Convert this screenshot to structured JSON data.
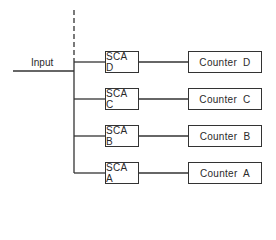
{
  "diagram": {
    "input_label": "Input",
    "channels": [
      {
        "sca": "SCA D",
        "counter": "Counter D",
        "y": 51
      },
      {
        "sca": "SCA C",
        "counter": "Counter C",
        "y": 88
      },
      {
        "sca": "SCA B",
        "counter": "Counter B",
        "y": 126
      },
      {
        "sca": "SCA A",
        "counter": "Counter A",
        "y": 162
      }
    ],
    "colors": {
      "line": "#333333",
      "text": "#2a2a2a",
      "background": "#ffffff"
    }
  }
}
